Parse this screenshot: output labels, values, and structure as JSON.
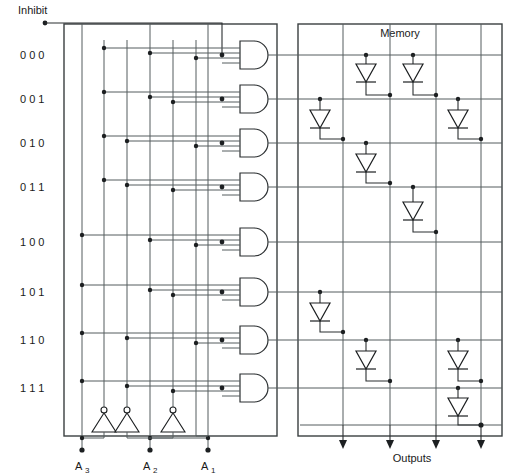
{
  "diagram": {
    "title_inhibit": "Inhibit",
    "title_memory": "Memory",
    "title_outputs": "Outputs",
    "address_rows": [
      {
        "index": 0,
        "label": "0  0  0",
        "bits": [
          0,
          0,
          0
        ],
        "y": 55
      },
      {
        "index": 1,
        "label": "0  0  1",
        "bits": [
          0,
          0,
          1
        ],
        "y": 99
      },
      {
        "index": 2,
        "label": "0  1  0",
        "bits": [
          0,
          1,
          0
        ],
        "y": 143
      },
      {
        "index": 3,
        "label": "0  1  1",
        "bits": [
          0,
          1,
          1
        ],
        "y": 187
      },
      {
        "index": 4,
        "label": "1  0  0",
        "bits": [
          1,
          0,
          0
        ],
        "y": 242
      },
      {
        "index": 5,
        "label": "1  0  1",
        "bits": [
          1,
          0,
          1
        ],
        "y": 292
      },
      {
        "index": 6,
        "label": "1  1  0",
        "bits": [
          1,
          1,
          0
        ],
        "y": 340
      },
      {
        "index": 7,
        "label": "1  1  1",
        "bits": [
          1,
          1,
          1
        ],
        "y": 388
      }
    ],
    "address_inputs": [
      {
        "name": "A3",
        "base": "A",
        "sub": "3",
        "x": 82
      },
      {
        "name": "A2",
        "base": "A",
        "sub": "2",
        "x": 150
      },
      {
        "name": "A1",
        "base": "A",
        "sub": "1",
        "x": 208
      }
    ],
    "decoder": {
      "gate_type": "AND",
      "gate_count": 8,
      "gate_inputs_each": 4,
      "inverter_count": 3,
      "inverter_type": "NOT",
      "column_lines": [
        82,
        104,
        127,
        150,
        173,
        208,
        222
      ]
    },
    "memory": {
      "output_columns": [
        {
          "index": 1,
          "x": 343
        },
        {
          "index": 2,
          "x": 390
        },
        {
          "index": 3,
          "x": 436
        },
        {
          "index": 4,
          "x": 481
        }
      ],
      "diode_matrix": [
        {
          "row": 0,
          "cols": [
            2,
            3
          ]
        },
        {
          "row": 1,
          "cols": [
            1,
            4
          ]
        },
        {
          "row": 2,
          "cols": [
            2
          ]
        },
        {
          "row": 3,
          "cols": [
            3
          ]
        },
        {
          "row": 4,
          "cols": []
        },
        {
          "row": 5,
          "cols": [
            1
          ]
        },
        {
          "row": 6,
          "cols": [
            2,
            4
          ]
        },
        {
          "row": 7,
          "cols": [
            4
          ]
        }
      ]
    },
    "colors": {
      "wire": "#555c5e",
      "wire_dark": "#2b2f31",
      "box": "#3a3f41",
      "text": "#1a1a1a",
      "background": "#ffffff"
    }
  }
}
